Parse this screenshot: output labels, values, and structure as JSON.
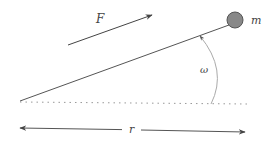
{
  "diagram": {
    "labels": {
      "force": "F",
      "mass": "m",
      "angular_velocity": "ω",
      "radius": "r"
    },
    "colors": {
      "line": "#555555",
      "mass_fill": "#888888",
      "mass_stroke": "#555555",
      "arc": "#aaaaaa",
      "dotted": "#999999",
      "text": "#444444"
    },
    "elements": [
      {
        "id": "rod",
        "type": "line",
        "from": [
          20,
          101
        ],
        "to": [
          229,
          25
        ]
      },
      {
        "id": "mass",
        "type": "circle",
        "center": [
          235,
          20
        ],
        "radius": 8,
        "label": "m"
      },
      {
        "id": "force-arrow",
        "type": "arrow",
        "from": [
          68,
          45
        ],
        "to": [
          152,
          15
        ],
        "label": "F"
      },
      {
        "id": "angle-arc",
        "type": "arc-arrow",
        "from": [
          211,
          104
        ],
        "to": [
          200,
          36
        ],
        "label": "ω"
      },
      {
        "id": "baseline",
        "type": "dotted-line",
        "from": [
          20,
          102
        ],
        "to": [
          247,
          104
        ]
      },
      {
        "id": "radius-arrow",
        "type": "double-arrow",
        "from": [
          20,
          128
        ],
        "to": [
          245,
          132
        ],
        "label": "r"
      }
    ]
  }
}
